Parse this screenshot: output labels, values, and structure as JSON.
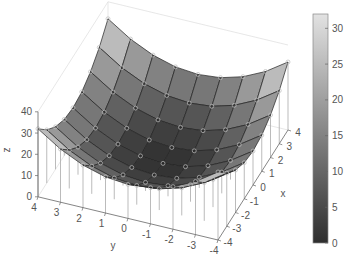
{
  "chart_data": {
    "type": "surface",
    "title": "",
    "function": "z = x^2 + y^2",
    "xlabel": "x",
    "ylabel": "y",
    "zlabel": "z",
    "x": [
      -4,
      -3,
      -2,
      -1,
      0,
      1,
      2,
      3,
      4
    ],
    "y": [
      -4,
      -3,
      -2,
      -1,
      0,
      1,
      2,
      3,
      4
    ],
    "z": [
      [
        32,
        25,
        20,
        17,
        16,
        17,
        20,
        25,
        32
      ],
      [
        25,
        18,
        13,
        10,
        9,
        10,
        13,
        18,
        25
      ],
      [
        20,
        13,
        8,
        5,
        4,
        5,
        8,
        13,
        20
      ],
      [
        17,
        10,
        5,
        2,
        1,
        2,
        5,
        10,
        17
      ],
      [
        16,
        9,
        4,
        1,
        0,
        1,
        4,
        9,
        16
      ],
      [
        17,
        10,
        5,
        2,
        1,
        2,
        5,
        10,
        17
      ],
      [
        20,
        13,
        8,
        5,
        4,
        5,
        8,
        13,
        20
      ],
      [
        25,
        18,
        13,
        10,
        9,
        10,
        13,
        18,
        25
      ],
      [
        32,
        25,
        20,
        17,
        16,
        17,
        20,
        25,
        32
      ]
    ],
    "xticks": [
      "-4",
      "-3",
      "-2",
      "-1",
      "0",
      "1",
      "2",
      "3",
      "4"
    ],
    "yticks": [
      "4",
      "3",
      "2",
      "1",
      "0",
      "-1",
      "-2",
      "-3",
      "-4"
    ],
    "zticks": [
      "0",
      "10",
      "20",
      "30",
      "40"
    ],
    "zlim": [
      0,
      40
    ],
    "overlay": "stem3 markers (circles) at each grid point",
    "colormap": "gray",
    "colorbar": {
      "ticks": [
        "0",
        "5",
        "10",
        "15",
        "20",
        "25",
        "30"
      ],
      "range": [
        0,
        32
      ],
      "color_low": "#2e2e2e",
      "color_high": "#e2e2e2"
    }
  }
}
